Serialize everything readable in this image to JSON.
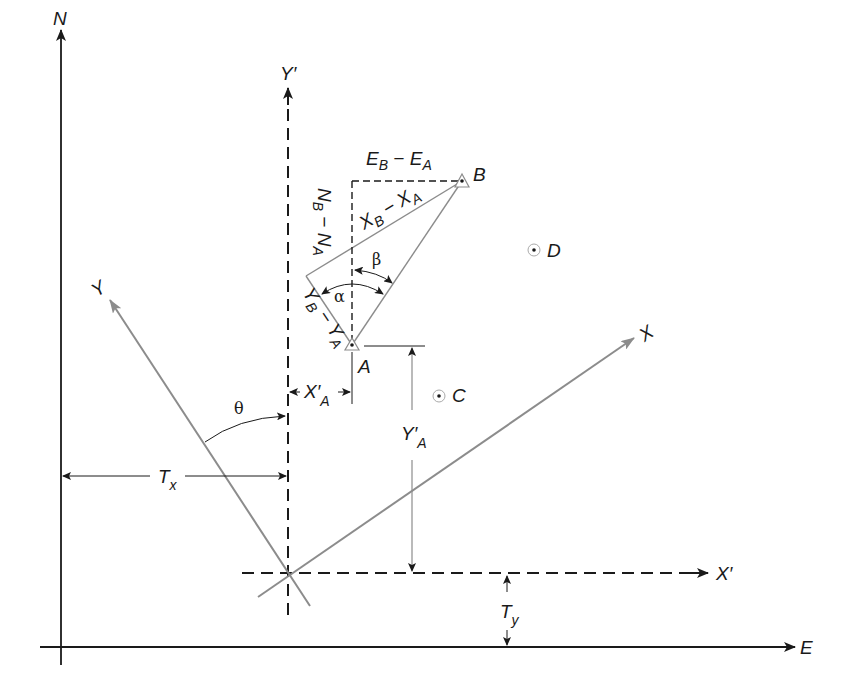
{
  "diagram": {
    "axes": {
      "north": "N",
      "east": "E",
      "y_prime": "Y′",
      "x_prime": "X′",
      "y_rotated": "Y",
      "x_rotated": "X"
    },
    "points": [
      {
        "name": "A"
      },
      {
        "name": "B"
      },
      {
        "name": "C"
      },
      {
        "name": "D"
      }
    ],
    "labels": {
      "eb_ea": {
        "main1": "E",
        "sub1": "B",
        "dash": " − ",
        "main2": "E",
        "sub2": "A"
      },
      "nb_na": {
        "main1": "N",
        "sub1": "B",
        "dash": " − ",
        "main2": "N",
        "sub2": "A"
      },
      "xb_xa": {
        "main1": "X",
        "sub1": "B",
        "dash": " − ",
        "main2": "X",
        "sub2": "A"
      },
      "yb_ya": {
        "main1": "Y",
        "sub1": "B",
        "dash": " − ",
        "main2": "Y",
        "sub2": "A"
      },
      "x_prime_a": {
        "main": "X′",
        "sub": "A"
      },
      "y_prime_a": {
        "main": "Y′",
        "sub": "A"
      },
      "tx": {
        "main": "T",
        "sub": "x"
      },
      "ty": {
        "main": "T",
        "sub": "y"
      }
    },
    "angles": {
      "alpha": "α",
      "beta": "β",
      "theta": "θ"
    },
    "colors": {
      "ink": "#1a1a1a",
      "rotated_grid": "#8c8c8c",
      "background": "#ffffff"
    }
  }
}
